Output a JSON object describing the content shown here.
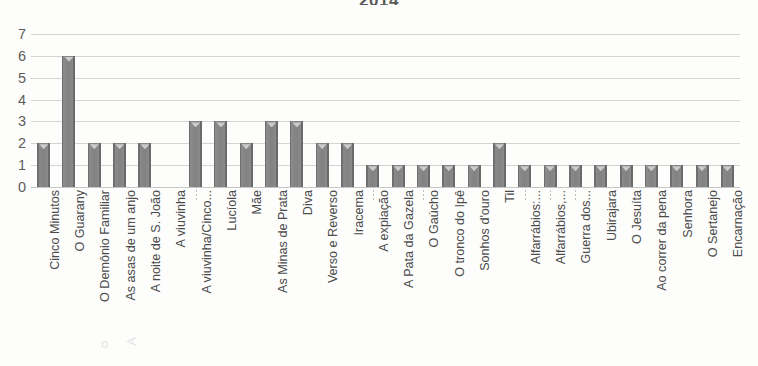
{
  "chart_data": {
    "type": "bar",
    "title": "2014",
    "xlabel": "",
    "ylabel": "",
    "ylim": [
      0,
      7
    ],
    "yticks": [
      0,
      1,
      2,
      3,
      4,
      5,
      6,
      7
    ],
    "grid": true,
    "legend": false,
    "series_color": "#808080",
    "categories": [
      "Cinco Minutos",
      "O Guarany",
      "O Demônio Familiar",
      "As asas de um anjo",
      "A noite de S. João",
      "A viuvinha",
      "A viuvinha/Cinco...",
      "Lucíola",
      "Mãe",
      "As Minas de Prata",
      "Diva",
      "Verso e Reverso",
      "Iracema",
      "A expiação",
      "A Pata da Gazela",
      "O Gaúcho",
      "O tronco do Ipê",
      "Sonhos d'ouro",
      "Til",
      "Alfarrábios:...",
      "Alfarrábios,...",
      "Guerra dos...",
      "Ubirajara",
      "O Jesuíta",
      "Ao correr da pena",
      "Senhora",
      "O Sertanejo",
      "Encarnação"
    ],
    "values": [
      2,
      6,
      2,
      2,
      2,
      0,
      3,
      3,
      2,
      3,
      3,
      2,
      2,
      1,
      1,
      1,
      1,
      1,
      2,
      1,
      1,
      1,
      1,
      1,
      1,
      1,
      1,
      1
    ]
  },
  "bleed": {
    "glyph_one": "o",
    "glyph_two": "A"
  }
}
